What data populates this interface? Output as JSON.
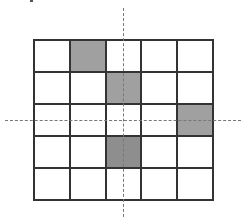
{
  "diagram": {
    "rows": 5,
    "cols": 5,
    "shaded_cells": [
      {
        "row": 0,
        "col": 1,
        "shade": "#a0a0a0"
      },
      {
        "row": 1,
        "col": 2,
        "shade": "#a0a0a0"
      },
      {
        "row": 2,
        "col": 4,
        "shade": "#a0a0a0"
      },
      {
        "row": 3,
        "col": 2,
        "shade": "#8e8e8e"
      }
    ],
    "axes": {
      "vertical_dashed_line": "symmetry axis through middle column",
      "horizontal_dashed_line": "symmetry axis through middle row"
    },
    "colors": {
      "grid_line": "#333333",
      "shaded": "#a0a0a0",
      "dark_shaded": "#8e8e8e",
      "dashed_axis": "#777777"
    }
  }
}
